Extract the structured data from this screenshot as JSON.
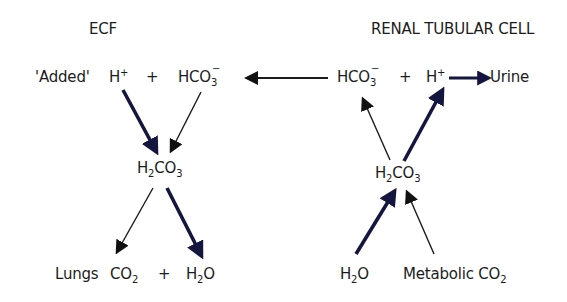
{
  "diagram": {
    "title_left": "ECF",
    "title_right": "RENAL TUBULAR CELL",
    "colors": {
      "bold_arrow": "#14163f",
      "thin_arrow": "#1a1a1a",
      "text": "#1c1c1c",
      "background": "#ffffff"
    },
    "ecf": {
      "added_label": "'Added'",
      "h_ion": {
        "base": "H",
        "sup": "+"
      },
      "plus_top": "+",
      "bicarbonate": {
        "base": "HCO",
        "sub": "3",
        "sup": "−"
      },
      "carbonic_acid": {
        "p1": "H",
        "s1": "2",
        "p2": "CO",
        "s2": "3"
      },
      "lungs_label": "Lungs",
      "co2": {
        "base": "CO",
        "sub": "2"
      },
      "plus_bottom": "+",
      "water": {
        "p1": "H",
        "s1": "2",
        "p2": "O"
      }
    },
    "renal": {
      "bicarbonate": {
        "base": "HCO",
        "sub": "3",
        "sup": "−"
      },
      "plus_top": "+",
      "h_ion": {
        "base": "H",
        "sup": "+"
      },
      "urine_label": "Urine",
      "carbonic_acid": {
        "p1": "H",
        "s1": "2",
        "p2": "CO",
        "s2": "3"
      },
      "water": {
        "p1": "H",
        "s1": "2",
        "p2": "O"
      },
      "metabolic_co2": {
        "base": "Metabolic CO",
        "sub": "2"
      }
    },
    "arrows": [
      {
        "from": "ECF H+",
        "to": "ECF H2CO3",
        "style": "bold"
      },
      {
        "from": "ECF HCO3-",
        "to": "ECF H2CO3",
        "style": "thin"
      },
      {
        "from": "ECF H2CO3",
        "to": "Lungs CO2",
        "style": "thin"
      },
      {
        "from": "ECF H2CO3",
        "to": "ECF H2O",
        "style": "bold"
      },
      {
        "from": "Renal HCO3-",
        "to": "ECF HCO3-",
        "style": "thin"
      },
      {
        "from": "Renal H+",
        "to": "Urine",
        "style": "bold"
      },
      {
        "from": "Renal H2CO3",
        "to": "Renal HCO3-",
        "style": "thin"
      },
      {
        "from": "Renal H2CO3",
        "to": "Renal H+",
        "style": "bold"
      },
      {
        "from": "Renal H2O",
        "to": "Renal H2CO3",
        "style": "bold"
      },
      {
        "from": "Metabolic CO2",
        "to": "Renal H2CO3",
        "style": "thin"
      }
    ]
  }
}
